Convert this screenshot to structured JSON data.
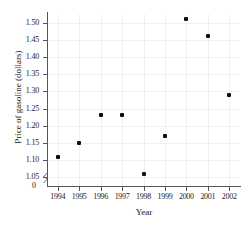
{
  "chart_data": {
    "type": "scatter",
    "title": "",
    "xlabel": "Year",
    "ylabel": "Price of gasoline (dollars)",
    "x": [
      1994,
      1995,
      1996,
      1997,
      1998,
      1999,
      2000,
      2001,
      2002
    ],
    "values": [
      1.11,
      1.15,
      1.23,
      1.23,
      1.06,
      1.17,
      1.51,
      1.46,
      1.29
    ],
    "points": [
      {
        "x": 1994,
        "y": 1.11
      },
      {
        "x": 1995,
        "y": 1.15
      },
      {
        "x": 1996,
        "y": 1.23
      },
      {
        "x": 1997,
        "y": 1.23
      },
      {
        "x": 1998,
        "y": 1.06
      },
      {
        "x": 1999,
        "y": 1.17
      },
      {
        "x": 2000,
        "y": 1.51
      },
      {
        "x": 2001,
        "y": 1.46
      },
      {
        "x": 2002,
        "y": 1.29
      }
    ],
    "xtick_labels": [
      "1994",
      "1995",
      "1996",
      "1997",
      "1998",
      "1999",
      "2000",
      "2001",
      "2002"
    ],
    "ytick_labels": [
      "1.50",
      "1.45",
      "1.40",
      "1.35",
      "1.30",
      "1.25",
      "1.20",
      "1.15",
      "1.10",
      "1.05"
    ],
    "ytick_values": [
      1.5,
      1.45,
      1.4,
      1.35,
      1.3,
      1.25,
      1.2,
      1.15,
      1.1,
      1.05
    ],
    "y_origin_label": "0",
    "ylim": [
      1.025,
      1.525
    ],
    "xlim": [
      1993.5,
      2002.5
    ],
    "grid": true,
    "legend": "none",
    "axis_break": "y-axis-break-zigzag",
    "marker_color": "#101010",
    "axis_color": "#555555",
    "grid_color": "#f0f0f0",
    "background_color": "#ffffff"
  }
}
